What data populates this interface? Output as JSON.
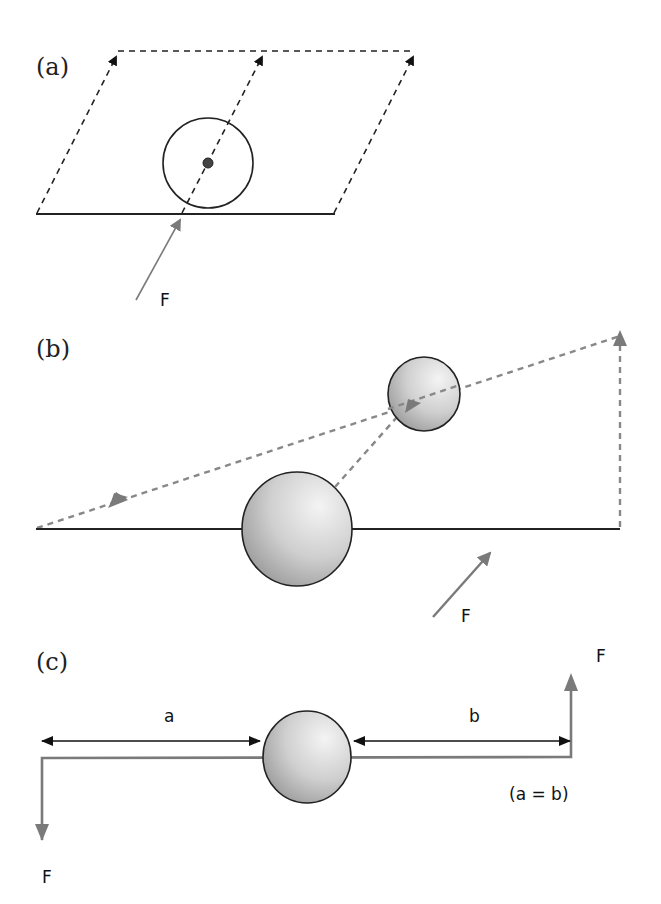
{
  "panels": {
    "a": {
      "label": "(a)",
      "force_label": "F",
      "description": "Parallelogram of dashed arrows; circle with center point on base line; force F applied at base"
    },
    "b": {
      "label": "(b)",
      "force_label": "F",
      "description": "Large sphere on base line with dashed vector triangle to smaller sphere; force F"
    },
    "c": {
      "label": "(c)",
      "force_top_label": "F",
      "force_bottom_label": "F",
      "distance_left_label": "a",
      "distance_right_label": "b",
      "condition_note": "(a = b)",
      "description": "Couple: equal and opposite forces at equal distances a and b from sphere"
    }
  },
  "colors": {
    "line_dark": "#222222",
    "arrow_gray": "#7a7a7a",
    "dash_gray": "#888888",
    "sphere_light": "#f2f2f2",
    "sphere_dark": "#9a9a9a"
  }
}
